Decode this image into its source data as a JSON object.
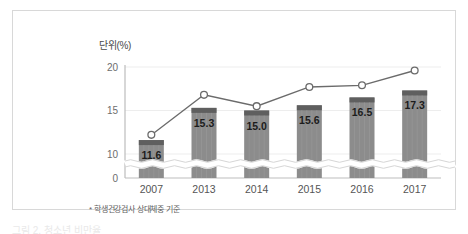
{
  "figure": {
    "unit_label": "단위(%)",
    "footnote": "* 학생건강검사 상대체중 기준",
    "caption_partial": "그림 2. 청소년 비만율"
  },
  "colors": {
    "bar_body": "#8c8c8c",
    "bar_cap": "#5f5f5f",
    "line": "#6b6b6b",
    "marker_fill": "#ffffff",
    "axis": "#bdbdbd",
    "grid": "#ededed",
    "frame": "#d8d8d8",
    "text": "#555555"
  },
  "chart_data": {
    "type": "bar",
    "title": "",
    "subtitle": "",
    "xlabel": "",
    "ylabel": "단위(%)",
    "ylim": [
      0,
      21.5
    ],
    "yticks": [
      0,
      10,
      15,
      20
    ],
    "ytick_labels": [
      "0",
      "10",
      "15",
      "20"
    ],
    "grid": true,
    "axis_break": true,
    "axis_break_value": 2.0,
    "legend": [],
    "categories": [
      "2007",
      "2013",
      "2014",
      "2015",
      "2016",
      "2017"
    ],
    "series": [
      {
        "name": "비만율(막대)",
        "type": "bar",
        "values": [
          11.6,
          15.3,
          15.0,
          15.6,
          16.5,
          17.3
        ],
        "labels": [
          "11.6",
          "15.3",
          "15.0",
          "15.6",
          "16.5",
          "17.3"
        ]
      },
      {
        "name": "추이(선)",
        "type": "line",
        "values": [
          12.2,
          16.8,
          15.5,
          17.7,
          17.9,
          19.6
        ],
        "labels": [
          "",
          "",
          "",
          "",
          "",
          ""
        ]
      }
    ]
  }
}
